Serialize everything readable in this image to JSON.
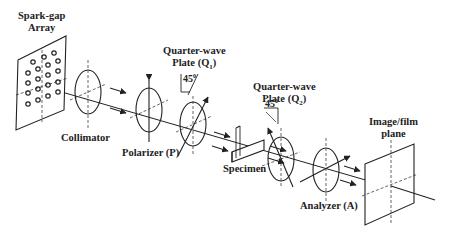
{
  "diagram": {
    "type": "optical-setup",
    "components": [
      {
        "id": "source",
        "label_line1": "Spark-gap",
        "label_line2": "Array"
      },
      {
        "id": "collimator",
        "label": "Collimator"
      },
      {
        "id": "polarizer",
        "label": "Polarizer (P)"
      },
      {
        "id": "q1",
        "label_line1": "Quarter-wave",
        "label_line2": "Plate (Q",
        "sub": "1",
        "close": ")",
        "angle": "45",
        "deg": "0"
      },
      {
        "id": "specimen",
        "label": "Specimen"
      },
      {
        "id": "q2",
        "label_line1": "Quarter-wave",
        "label_line2": "Plate (Q",
        "sub": "2",
        "close": ")",
        "angle": "45",
        "deg": "0"
      },
      {
        "id": "analyzer",
        "label": "Analyzer (A)"
      },
      {
        "id": "screen",
        "label_line1": "Image/film",
        "label_line2": "plane"
      }
    ],
    "colors": {
      "line": "#222222",
      "background": "#ffffff"
    }
  }
}
